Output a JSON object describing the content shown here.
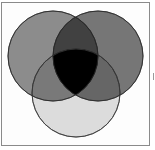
{
  "diagram": {
    "type": "venn",
    "set_count": 3,
    "sets": [
      {
        "id": "A",
        "position": "top-left",
        "cx": 53,
        "cy": 56,
        "r": 45,
        "color": "#8c8c8c"
      },
      {
        "id": "B",
        "position": "top-right",
        "cx": 98,
        "cy": 56,
        "r": 45,
        "color": "#767676"
      },
      {
        "id": "C",
        "position": "bottom",
        "cx": 76,
        "cy": 93,
        "r": 44,
        "color": "#dcdcdc"
      }
    ],
    "center_intersection_color": "#000000",
    "frame_color": "#8a8a8a",
    "background": "#ffffff"
  }
}
